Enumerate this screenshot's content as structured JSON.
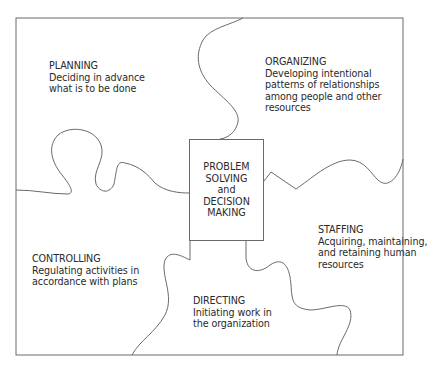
{
  "diagram": {
    "type": "puzzle-diagram",
    "center": {
      "lines": [
        "PROBLEM",
        "SOLVING",
        "and",
        "DECISION",
        "MAKING"
      ]
    },
    "pieces": [
      {
        "id": "planning",
        "title": "PLANNING",
        "desc": [
          "Deciding in advance",
          "what is to be done"
        ]
      },
      {
        "id": "organizing",
        "title": "ORGANIZING",
        "desc": [
          "Developing intentional",
          "patterns of relationships",
          "among people and other",
          "resources"
        ]
      },
      {
        "id": "staffing",
        "title": "STAFFING",
        "desc": [
          "Acquiring, maintaining,",
          "and retaining human",
          "resources"
        ]
      },
      {
        "id": "directing",
        "title": "DIRECTING",
        "desc": [
          "Initiating work in",
          "the organization"
        ]
      },
      {
        "id": "controlling",
        "title": "CONTROLLING",
        "desc": [
          "Regulating activities in",
          "accordance with plans"
        ]
      }
    ],
    "colors": {
      "line": "#6a6a6a",
      "text": "#2a2a2a",
      "background": "#ffffff"
    }
  }
}
